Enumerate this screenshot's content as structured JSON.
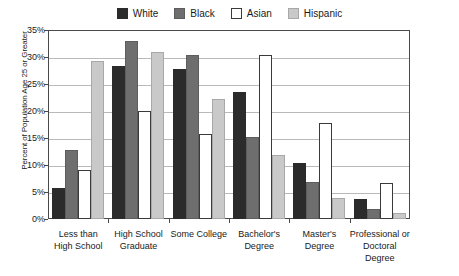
{
  "chart_data": {
    "type": "bar",
    "title": "",
    "subtitle": "",
    "xlabel": "",
    "ylabel": "Percent of Population Age 25 or Greater",
    "ylim": [
      0,
      35
    ],
    "yticks": [
      "0%",
      "5%",
      "10%",
      "15%",
      "20%",
      "25%",
      "30%",
      "35%"
    ],
    "ytick_values": [
      0,
      5,
      10,
      15,
      20,
      25,
      30,
      35
    ],
    "grid": true,
    "legend_position": "top-center",
    "categories": [
      "Less than High School",
      "High School Graduate",
      "Some College",
      "Bachelor's Degree",
      "Master's Degree",
      "Professional or Doctoral Degree"
    ],
    "category_lines": [
      [
        "Less than",
        "High School"
      ],
      [
        "High School",
        "Graduate"
      ],
      [
        "Some College",
        ""
      ],
      [
        "Bachelor's",
        "Degree"
      ],
      [
        "Master's Degree",
        ""
      ],
      [
        "Professional or",
        "Doctoral Degree"
      ]
    ],
    "series": [
      {
        "name": "White",
        "color": "#2b2b2b",
        "values": [
          5.8,
          28.3,
          27.8,
          23.5,
          10.4,
          3.7
        ]
      },
      {
        "name": "Black",
        "color": "#6e6e6e",
        "values": [
          12.7,
          33.0,
          30.3,
          15.2,
          6.9,
          1.9
        ]
      },
      {
        "name": "Asian",
        "color": "#ffffff",
        "values": [
          9.0,
          20.0,
          15.7,
          30.4,
          17.7,
          6.6
        ]
      },
      {
        "name": "Hispanic",
        "color": "#c9c9c9",
        "values": [
          29.3,
          31.0,
          22.2,
          11.9,
          3.9,
          1.2
        ]
      }
    ]
  },
  "legend": {
    "items": [
      {
        "label": "White",
        "swatch": "white-swatch"
      },
      {
        "label": "Black",
        "swatch": "black-swatch"
      },
      {
        "label": "Asian",
        "swatch": "asian-swatch"
      },
      {
        "label": "Hispanic",
        "swatch": "hispanic-swatch"
      }
    ]
  }
}
